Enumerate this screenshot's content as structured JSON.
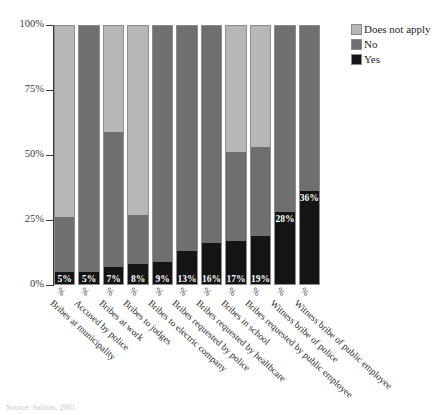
{
  "title": "",
  "source_note": "Source: Salinas, 2001",
  "legend": {
    "position": "right-top",
    "items": [
      {
        "label": "Does not apply",
        "color": "#b7b7b7",
        "key": "does_not_apply"
      },
      {
        "label": "No",
        "color": "#6f6f6f",
        "key": "no"
      },
      {
        "label": "Yes",
        "color": "#151515",
        "key": "yes"
      }
    ]
  },
  "axis": {
    "y_ticks": [
      "0%",
      "25%",
      "50%",
      "75%",
      "100%"
    ],
    "y_tick_values": [
      0,
      25,
      50,
      75,
      100
    ],
    "y_min": 0,
    "y_max": 100,
    "x_suffix": "%"
  },
  "chart_data": {
    "type": "bar",
    "stacked": true,
    "title": "",
    "xlabel": "",
    "ylabel": "",
    "ylim": [
      0,
      100
    ],
    "grid": false,
    "legend_position": "right",
    "categories": [
      "Bribes at municipality",
      "Accused by police",
      "Bribes at work",
      "Bribes to judges",
      "Bribes to electric company",
      "Bribes requested by police",
      "Bribes requested by healthcare",
      "Bribes in school",
      "Bribes requested by public employee",
      "Witness bribe of police",
      "Witness bribe of public employee"
    ],
    "category_tick_suffix": [
      "%",
      "%",
      "%",
      "%",
      "%",
      "%",
      "%",
      "%",
      "%",
      "%",
      "%"
    ],
    "series": [
      {
        "name": "Yes",
        "color": "#151515",
        "values": [
          5,
          5,
          7,
          8,
          9,
          13,
          16,
          17,
          19,
          28,
          36
        ],
        "labels": [
          "5%",
          "5%",
          "7%",
          "8%",
          "9%",
          "13%",
          "16%",
          "17%",
          "19%",
          "28%",
          "36%"
        ]
      },
      {
        "name": "No",
        "color": "#6f6f6f",
        "values": [
          21,
          95,
          52,
          19,
          91,
          87,
          84,
          34,
          34,
          72,
          64
        ]
      },
      {
        "name": "Does not apply",
        "color": "#b7b7b7",
        "values": [
          74,
          0,
          41,
          73,
          0,
          0,
          0,
          49,
          47,
          0,
          0
        ]
      }
    ]
  }
}
